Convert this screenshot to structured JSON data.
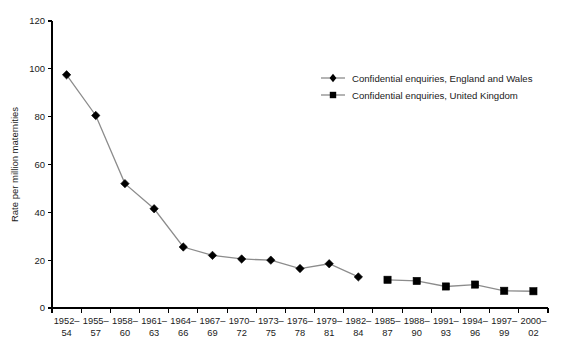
{
  "chart_data": {
    "type": "line",
    "title": "",
    "xlabel": "",
    "ylabel": "Rate per million maternities",
    "ylim": [
      0,
      120
    ],
    "yticks": [
      0,
      20,
      40,
      60,
      80,
      100,
      120
    ],
    "grid": false,
    "legend_position": "upper-right-inside",
    "categories": [
      "1952–54",
      "1955–57",
      "1958–60",
      "1961–63",
      "1964–66",
      "1967–69",
      "1970–72",
      "1973–75",
      "1976–78",
      "1979–81",
      "1982–84",
      "1985–87",
      "1988–90",
      "1991–93",
      "1994–96",
      "1997–99",
      "2000–02"
    ],
    "series": [
      {
        "name": "Confidential enquiries, England and Wales",
        "marker": "diamond",
        "color": "#000000",
        "line_color": "#8c8c8c",
        "values": [
          97.5,
          80.5,
          52.0,
          41.5,
          25.5,
          22.0,
          20.5,
          20.0,
          16.5,
          18.5,
          13.0,
          null,
          null,
          null,
          null,
          null,
          null
        ]
      },
      {
        "name": "Confidential enquiries, United Kingdom",
        "marker": "square",
        "color": "#000000",
        "line_color": "#8c8c8c",
        "values": [
          null,
          null,
          null,
          null,
          null,
          null,
          null,
          null,
          null,
          null,
          null,
          11.8,
          11.3,
          9.0,
          9.8,
          7.2,
          7.0
        ]
      }
    ]
  },
  "axis": {
    "y_title": "Rate per million maternities",
    "y_tick_labels": [
      "0",
      "20",
      "40",
      "60",
      "80",
      "100",
      "120"
    ],
    "x_tick_labels_line1": [
      "1952–",
      "1955–",
      "1958–",
      "1961–",
      "1964–",
      "1967–",
      "1970–",
      "1973–",
      "1976–",
      "1979–",
      "1982–",
      "1985–",
      "1988–",
      "1991–",
      "1994–",
      "1997–",
      "2000–"
    ],
    "x_tick_labels_line2": [
      "54",
      "57",
      "60",
      "63",
      "66",
      "69",
      "72",
      "75",
      "78",
      "81",
      "84",
      "87",
      "90",
      "93",
      "96",
      "99",
      "02"
    ]
  },
  "legend": {
    "items": [
      {
        "label": "Confidential enquiries, England and Wales",
        "marker": "diamond-marker"
      },
      {
        "label": "Confidential enquiries, United Kingdom",
        "marker": "square-marker"
      }
    ]
  }
}
